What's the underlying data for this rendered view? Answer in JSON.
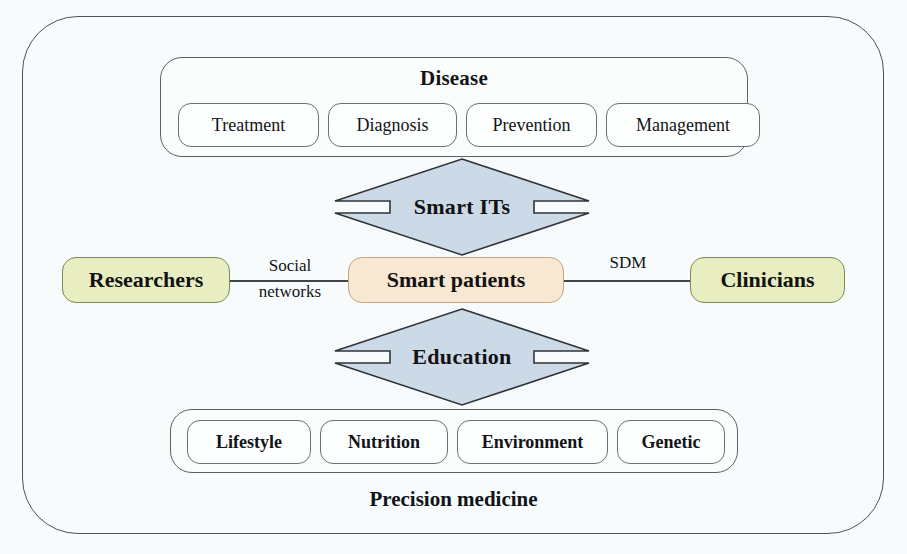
{
  "figure": {
    "background_color": "#f8fbfc",
    "frame_color": "#4b5358"
  },
  "disease_group": {
    "title": "Disease",
    "items": [
      {
        "label": "Treatment"
      },
      {
        "label": "Diagnosis"
      },
      {
        "label": "Prevention"
      },
      {
        "label": "Management"
      }
    ]
  },
  "precision_group": {
    "caption": "Precision medicine",
    "items": [
      {
        "label": "Lifestyle"
      },
      {
        "label": "Nutrition"
      },
      {
        "label": "Environment"
      },
      {
        "label": "Genetic"
      }
    ]
  },
  "actors": {
    "left": {
      "label": "Researchers",
      "color": "#e8eec2"
    },
    "center": {
      "label": "Smart patients",
      "color": "#f8e7d3"
    },
    "right": {
      "label": "Clinicians",
      "color": "#e8eec2"
    }
  },
  "edges": {
    "left_label_line1": "Social",
    "left_label_line2": "networks",
    "right_label": "SDM"
  },
  "arrows": {
    "top": {
      "label": "Smart ITs",
      "fill": "#ccd9e6"
    },
    "bottom": {
      "label": "Education",
      "fill": "#ccd9e6"
    }
  }
}
